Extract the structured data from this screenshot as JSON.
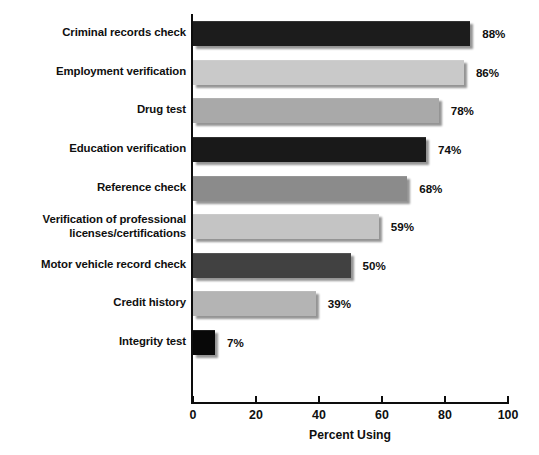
{
  "chart_data": {
    "type": "bar",
    "orientation": "horizontal",
    "title": "",
    "xlabel": "Percent Using",
    "ylabel": "",
    "xlim": [
      0,
      100
    ],
    "xticks": [
      "0",
      "20",
      "40",
      "60",
      "80",
      "100"
    ],
    "grid": false,
    "legend": "none",
    "categories": [
      "Criminal records check",
      "Employment verification",
      "Drug test",
      "Education verification",
      "Reference check",
      "Verification of professional\nlicenses/certifications",
      "Motor vehicle record check",
      "Credit history",
      "Integrity test"
    ],
    "values": [
      88,
      86,
      78,
      74,
      68,
      59,
      50,
      39,
      7
    ],
    "value_labels": [
      "88%",
      "86%",
      "78%",
      "74%",
      "68%",
      "59%",
      "50%",
      "39%",
      "7%"
    ],
    "bar_colors": [
      "#1c1c1c",
      "#c9c9c9",
      "#a9a9a9",
      "#191919",
      "#8b8b8b",
      "#c4c4c4",
      "#414141",
      "#b4b4b4",
      "#080808"
    ]
  },
  "axis": {
    "x_title": "Percent Using",
    "ticks": [
      {
        "label": "0",
        "value": 0
      },
      {
        "label": "20",
        "value": 20
      },
      {
        "label": "40",
        "value": 40
      },
      {
        "label": "60",
        "value": 60
      },
      {
        "label": "80",
        "value": 80
      },
      {
        "label": "100",
        "value": 100
      }
    ]
  }
}
